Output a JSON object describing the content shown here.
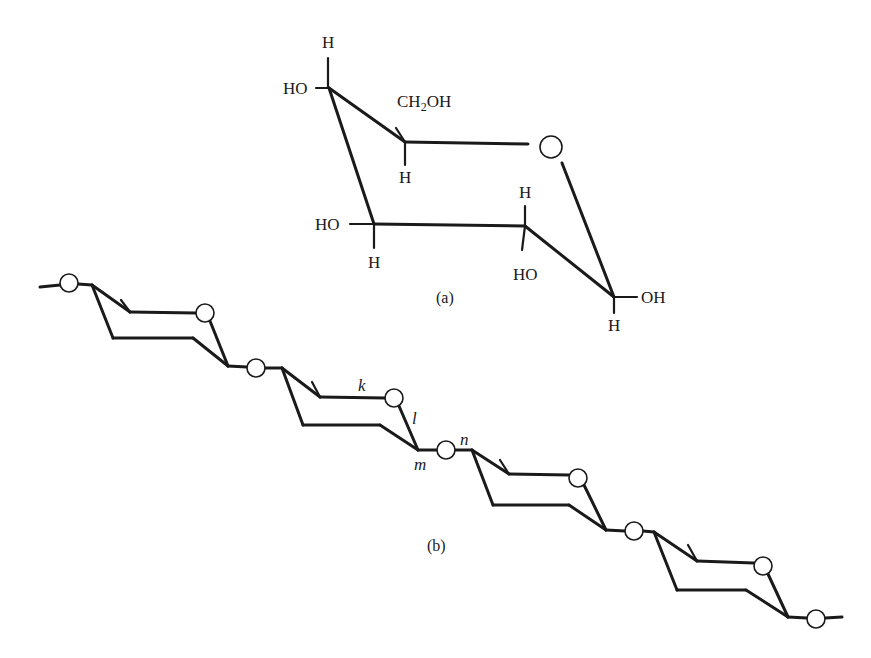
{
  "figure": {
    "panel_a": {
      "caption": "(a)",
      "description": "Chair conformation of a glucopyranose ring",
      "labels": {
        "c4_h": "H",
        "c4_oh": "HO",
        "c5_sub": "CH",
        "c5_sub_sub": "2",
        "c5_sub_end": "OH",
        "c5_h": "H",
        "c3_oh": "HO",
        "c3_h": "H",
        "c2_h": "H",
        "c2_oh": "HO",
        "c1_oh": "OH",
        "c1_h": "H"
      }
    },
    "panel_b": {
      "caption": "(b)",
      "description": "Chain of linked chair rings connected through glycosidic oxygen atoms",
      "ring_count": 4,
      "labels": {
        "k": "k",
        "l": "l",
        "m": "m",
        "n": "n"
      }
    },
    "colors": {
      "ink": "#1a1a1a",
      "background": "#ffffff"
    }
  }
}
